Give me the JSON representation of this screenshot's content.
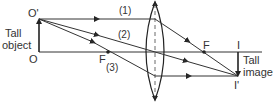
{
  "diagram": {
    "labels": {
      "object_top": "O'",
      "object_base": "O",
      "object_caption_line1": "Tall",
      "object_caption_line2": "object",
      "focus_left": "F",
      "focus_right": "F",
      "image_base": "I",
      "image_top": "I'",
      "image_caption_line1": "Tall",
      "image_caption_line2": "image",
      "ray1": "(1)",
      "ray2": "(2)",
      "ray3": "(3)"
    },
    "colors": {
      "line": "#333333",
      "background": "#ffffff"
    }
  }
}
